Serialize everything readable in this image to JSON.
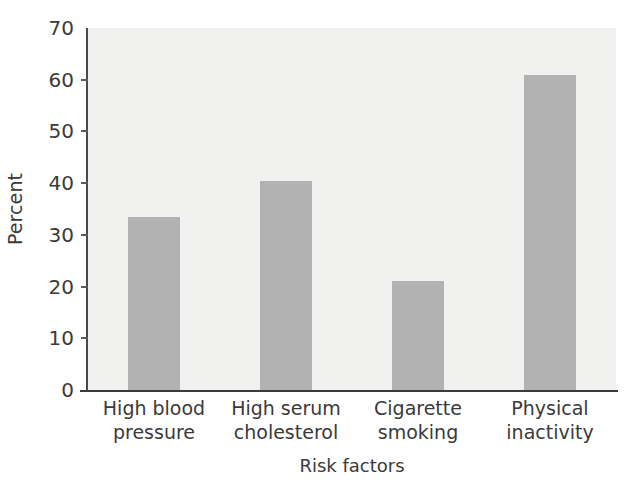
{
  "chart_data": {
    "type": "bar",
    "title": "",
    "subtitle": "",
    "xlabel": "Risk factors",
    "ylabel": "Percent",
    "categories": [
      "High blood pressure",
      "High serum cholesterol",
      "Cigarette smoking",
      "Physical inactivity"
    ],
    "category_lines": [
      [
        "High blood",
        "pressure"
      ],
      [
        "High serum",
        "cholesterol"
      ],
      [
        "Cigarette",
        "smoking"
      ],
      [
        "Physical",
        "inactivity"
      ]
    ],
    "values": [
      33.5,
      40.5,
      21.0,
      61.0
    ],
    "ylim": [
      0,
      70
    ],
    "ytick_labels": [
      "0",
      "10",
      "20",
      "30",
      "40",
      "50",
      "60",
      "70"
    ],
    "ytick_values": [
      0,
      10,
      20,
      30,
      40,
      50,
      60,
      70
    ],
    "grid": false,
    "legend": "none",
    "colors": {
      "bar_fill": "#b2b2b2",
      "plot_background": "#f1f1f0",
      "axis": "#3a3a3a",
      "text": "#3a3a3a",
      "page_background": "#ffffff"
    }
  }
}
